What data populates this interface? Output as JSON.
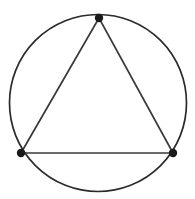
{
  "figure": {
    "background_color": "#ffffff",
    "width": 195,
    "height": 199
  },
  "chart_data": {
    "type": "diagram",
    "xlabel": "",
    "ylabel": "",
    "grid": false,
    "legend": null,
    "shapes": [
      {
        "name": "circumcircle",
        "kind": "circle",
        "center_x": 98,
        "center_y": 103,
        "radius": 88.5,
        "stroke": "#2b2b2b",
        "stroke_width": 1.7,
        "fill": "none"
      },
      {
        "name": "inscribed-triangle",
        "kind": "polygon",
        "points": "99,18 21,153 173,153",
        "stroke": "#3a3a3a",
        "stroke_width": 1.7,
        "fill": "none"
      }
    ],
    "points": [
      {
        "name": "vertex-top",
        "x": 99,
        "y": 18,
        "radius": 4.2,
        "color": "#1a1a1a"
      },
      {
        "name": "vertex-bottom-left",
        "x": 21,
        "y": 153,
        "radius": 4.2,
        "color": "#1a1a1a"
      },
      {
        "name": "vertex-bottom-right",
        "x": 173,
        "y": 153,
        "radius": 4.2,
        "color": "#1a1a1a"
      }
    ],
    "annotations": []
  },
  "colors": {
    "stroke_circle": "#2b2b2b",
    "stroke_triangle": "#3a3a3a",
    "vertex_fill": "#1a1a1a",
    "background": "#ffffff"
  }
}
